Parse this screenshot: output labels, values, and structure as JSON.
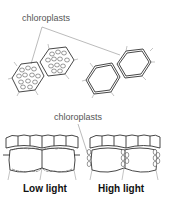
{
  "figure": {
    "top_label": "chloroplasts",
    "bottom_label": "chloroplasts",
    "captions": {
      "low_light": "Low light",
      "high_light": "High light"
    },
    "panels": [
      {
        "name": "surface-view-low-light",
        "description": "hexagonal cells with chloroplasts spread across face"
      },
      {
        "name": "surface-view-high-light",
        "description": "hexagonal cells with chloroplasts lined along walls"
      },
      {
        "name": "cross-section-low-light",
        "description": "chloroplasts along top and bottom cell walls"
      },
      {
        "name": "cross-section-high-light",
        "description": "chloroplasts along side cell walls"
      }
    ],
    "colors": {
      "line": "#333333",
      "leader": "#777777",
      "background": "#ffffff"
    }
  }
}
